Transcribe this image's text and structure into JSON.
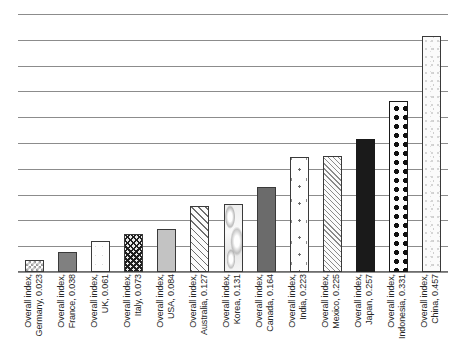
{
  "chart_data": {
    "type": "bar",
    "title": "",
    "subtitle": "",
    "xlabel": "",
    "ylabel": "",
    "ylim": [
      0,
      0.5
    ],
    "ytick_values": [
      0.0,
      0.05,
      0.1,
      0.15,
      0.2,
      0.25,
      0.3,
      0.35,
      0.4,
      0.45,
      0.5
    ],
    "ytick_labels": [],
    "grid": "horizontal",
    "legend": "none",
    "series_name": "Overall index",
    "categories": [
      "Overall index, Germany, 0.023",
      "Overall index, France, 0.038",
      "Overall index, UK, 0.061",
      "Overall index, Italy, 0.073",
      "Overall index, USA, 0.084",
      "Overall index, Australia, 0.127",
      "Overall index, Korea, 0.131",
      "Overall index, Canada, 0.164",
      "Overall index, India, 0.223",
      "Overall index, Mexico, 0.225",
      "Overall index, Japan, 0.257",
      "Overall index, Indonesia, 0.331",
      "Overall index, China, 0.457"
    ],
    "values": [
      0.023,
      0.038,
      0.061,
      0.073,
      0.084,
      0.127,
      0.131,
      0.164,
      0.223,
      0.225,
      0.257,
      0.331,
      0.457
    ],
    "country_names": [
      "Germany",
      "France",
      "UK",
      "Italy",
      "USA",
      "Australia",
      "Korea",
      "Canada",
      "India",
      "Mexico",
      "Japan",
      "Indonesia",
      "China"
    ]
  },
  "axis": {
    "gridline_count": 11,
    "baseline_color": "#6e6e6e",
    "gridline_color": "#8c8c8c"
  },
  "bars": [
    {
      "country": "Germany",
      "value": 0.023,
      "value_text": "0.023",
      "label_line1": "Overall index,",
      "label_line2": "Germany, 0.023",
      "pattern": "light-checkerboard",
      "fill_class": "fill-checker",
      "border_color": "#3a3a3a"
    },
    {
      "country": "France",
      "value": 0.038,
      "value_text": "0.038",
      "label_line1": "Overall index,",
      "label_line2": "France, 0.038",
      "pattern": "solid-medium-gray",
      "fill_class": "fill-solid-midgray",
      "border_color": "#3a3a3a"
    },
    {
      "country": "UK",
      "value": 0.061,
      "value_text": "0.061",
      "label_line1": "Overall index,",
      "label_line2": "UK, 0.061",
      "pattern": "white-speckled",
      "fill_class": "fill-white-speck",
      "border_color": "#3a3a3a"
    },
    {
      "country": "Italy",
      "value": 0.073,
      "value_text": "0.073",
      "label_line1": "Overall index,",
      "label_line2": "Italy, 0.073",
      "pattern": "dark-crosshatch",
      "fill_class": "fill-dark-crosshatch",
      "border_color": "#3a3a3a"
    },
    {
      "country": "USA",
      "value": 0.084,
      "value_text": "0.084",
      "label_line1": "Overall index,",
      "label_line2": "USA, 0.084",
      "pattern": "solid-light-gray",
      "fill_class": "fill-solid-lightgray",
      "border_color": "#3a3a3a"
    },
    {
      "country": "Australia",
      "value": 0.127,
      "value_text": "0.127",
      "label_line1": "Overall index,",
      "label_line2": "Australia, 0.127",
      "pattern": "diagonal-hatch",
      "fill_class": "fill-diag-hatch",
      "border_color": "#3a3a3a"
    },
    {
      "country": "Korea",
      "value": 0.131,
      "value_text": "0.131",
      "label_line1": "Overall index,",
      "label_line2": "Korea, 0.131",
      "pattern": "marble-texture",
      "fill_class": "fill-marble",
      "border_color": "#3a3a3a"
    },
    {
      "country": "Canada",
      "value": 0.164,
      "value_text": "0.164",
      "label_line1": "Overall index,",
      "label_line2": "Canada, 0.164",
      "pattern": "solid-dark-gray",
      "fill_class": "fill-solid-darkgray",
      "border_color": "#3a3a3a"
    },
    {
      "country": "India",
      "value": 0.223,
      "value_text": "0.223",
      "label_line1": "Overall index,",
      "label_line2": "India, 0.223",
      "pattern": "sparse-dots",
      "fill_class": "fill-sparse-dots",
      "border_color": "#3a3a3a"
    },
    {
      "country": "Mexico",
      "value": 0.225,
      "value_text": "0.225",
      "label_line1": "Overall index,",
      "label_line2": "Mexico, 0.225",
      "pattern": "fine-diagonal-hatch",
      "fill_class": "fill-fine-hatch",
      "border_color": "#3a3a3a"
    },
    {
      "country": "Japan",
      "value": 0.257,
      "value_text": "0.257",
      "label_line1": "Overall index,",
      "label_line2": "Japan, 0.257",
      "pattern": "solid-black",
      "fill_class": "fill-solid-black",
      "border_color": "#1a1a1a"
    },
    {
      "country": "Indonesia",
      "value": 0.331,
      "value_text": "0.331",
      "label_line1": "Overall index,",
      "label_line2": "Indonesia, 0.331",
      "pattern": "large-polka-dots",
      "fill_class": "fill-polka",
      "border_color": "#1a1a1a"
    },
    {
      "country": "China",
      "value": 0.457,
      "value_text": "0.457",
      "label_line1": "Overall index,",
      "label_line2": "China, 0.457",
      "pattern": "light-noise",
      "fill_class": "fill-light-noise",
      "border_color": "#3a3a3a"
    }
  ]
}
